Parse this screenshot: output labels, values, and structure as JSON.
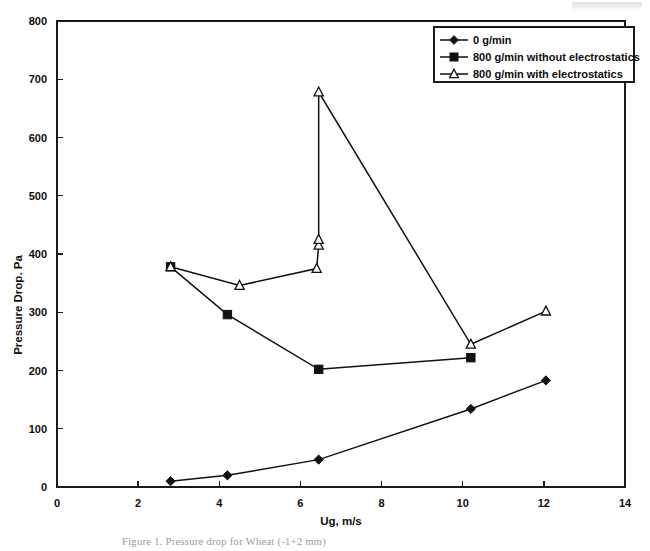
{
  "figure": {
    "caption": "Figure 1. Pressure drop for Wheat (-1+2 mm)",
    "y_axis_title": "Pressure Drop. Pa",
    "x_axis_title": "Ug, m/s"
  },
  "chart_data": {
    "type": "line",
    "title": "",
    "xlabel": "Ug, m/s",
    "ylabel": "Pressure Drop. Pa",
    "xlim": [
      0,
      14
    ],
    "ylim": [
      0,
      800
    ],
    "xticks": [
      0,
      2,
      4,
      6,
      8,
      10,
      12,
      14
    ],
    "yticks": [
      0,
      100,
      200,
      300,
      400,
      500,
      600,
      700,
      800
    ],
    "grid": false,
    "legend_position": "top-right",
    "series": [
      {
        "name": "0 g/min",
        "marker": "diamond-filled",
        "x": [
          2.8,
          4.2,
          6.45,
          10.2,
          12.05
        ],
        "y": [
          10,
          20,
          47,
          134,
          183
        ]
      },
      {
        "name": "800 g/min without electrostatics",
        "marker": "square-filled",
        "x": [
          2.8,
          4.2,
          6.45,
          10.2
        ],
        "y": [
          378,
          296,
          202,
          222
        ]
      },
      {
        "name": "800 g/min with electrostatics",
        "marker": "triangle-open",
        "x": [
          2.8,
          4.5,
          6.4,
          6.45,
          6.45,
          6.45,
          10.2,
          12.05
        ],
        "y": [
          378,
          346,
          375,
          415,
          425,
          678,
          245,
          302
        ]
      }
    ]
  },
  "legend": {
    "entries": [
      {
        "label": "0 g/min",
        "marker": "diamond-filled"
      },
      {
        "label": "800 g/min without electrostatics",
        "marker": "square-filled"
      },
      {
        "label": "800 g/min with electrostatics",
        "marker": "triangle-open"
      }
    ]
  },
  "axes": {
    "x_tick_labels": [
      "0",
      "2",
      "4",
      "6",
      "8",
      "10",
      "12",
      "14"
    ],
    "y_tick_labels": [
      "0",
      "100",
      "200",
      "300",
      "400",
      "500",
      "600",
      "700",
      "800"
    ]
  }
}
